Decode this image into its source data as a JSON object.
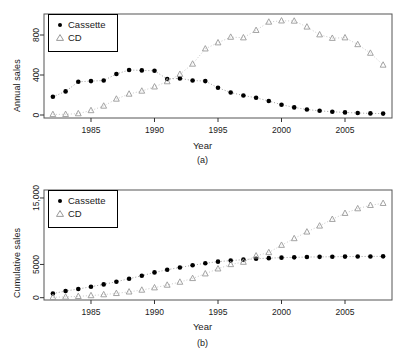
{
  "figure": {
    "panels": [
      {
        "id": "a",
        "caption": "(a)",
        "xlabel": "Year",
        "ylabel": "Annual sales",
        "legend": [
          {
            "label": "Cassette",
            "symbol": "filled-circle"
          },
          {
            "label": "CD",
            "symbol": "open-triangle"
          }
        ]
      },
      {
        "id": "b",
        "caption": "(b)",
        "xlabel": "Year",
        "ylabel": "Cumulative sales",
        "legend": [
          {
            "label": "Cassette",
            "symbol": "filled-circle"
          },
          {
            "label": "CD",
            "symbol": "open-triangle"
          }
        ]
      }
    ]
  },
  "chart_data": [
    {
      "type": "scatter",
      "panel": "a",
      "title": "",
      "xlabel": "Year",
      "ylabel": "Annual sales",
      "xlim": [
        1981.3,
        2008.7
      ],
      "ylim": [
        -30,
        1010
      ],
      "xticks": [
        1985,
        1990,
        1995,
        2000,
        2005
      ],
      "yticks": [
        0,
        400,
        800
      ],
      "ytick_labels": [
        "0",
        "400",
        "800"
      ],
      "grid": false,
      "legend_position": "top-left",
      "x": [
        1982,
        1983,
        1984,
        1985,
        1986,
        1987,
        1988,
        1989,
        1990,
        1991,
        1992,
        1993,
        1994,
        1995,
        1996,
        1997,
        1998,
        1999,
        2000,
        2001,
        2002,
        2003,
        2004,
        2005,
        2006,
        2007,
        2008
      ],
      "series": [
        {
          "name": "Cassette",
          "symbol": "filled-circle",
          "color": "#000000",
          "values": [
            182,
            236,
            332,
            339,
            345,
            410,
            450,
            446,
            442,
            360,
            366,
            345,
            339,
            272,
            225,
            195,
            172,
            140,
            103,
            76,
            55,
            42,
            32,
            26,
            20,
            16,
            14
          ]
        },
        {
          "name": "CD",
          "symbol": "open-triangle",
          "color": "#9a9a9a",
          "values": [
            6,
            7,
            14,
            45,
            90,
            160,
            210,
            240,
            282,
            334,
            408,
            510,
            662,
            723,
            779,
            773,
            847,
            930,
            942,
            940,
            881,
            803,
            768,
            773,
            705,
            619,
            500
          ]
        }
      ]
    },
    {
      "type": "scatter",
      "panel": "b",
      "title": "",
      "xlabel": "Year",
      "ylabel": "Cumulative sales",
      "xlim": [
        1981.3,
        2008.7
      ],
      "ylim": [
        -350,
        16200
      ],
      "xticks": [
        1985,
        1990,
        1995,
        2000,
        2005
      ],
      "yticks": [
        0,
        5000,
        15000
      ],
      "ytick_labels": [
        "0",
        "5000",
        "15,000"
      ],
      "grid": false,
      "legend_position": "top-left",
      "x": [
        1982,
        1983,
        1984,
        1985,
        1986,
        1987,
        1988,
        1989,
        1990,
        1991,
        1992,
        1993,
        1994,
        1995,
        1996,
        1997,
        1998,
        1999,
        2000,
        2001,
        2002,
        2003,
        2004,
        2005,
        2006,
        2007,
        2008
      ],
      "series": [
        {
          "name": "Cassette",
          "symbol": "filled-circle",
          "color": "#000000",
          "values": [
            620,
            1000,
            1300,
            1650,
            2000,
            2400,
            2850,
            3300,
            3800,
            4200,
            4550,
            4880,
            5180,
            5420,
            5580,
            5720,
            5860,
            5950,
            6020,
            6070,
            6110,
            6140,
            6160,
            6180,
            6195,
            6205,
            6215
          ]
        },
        {
          "name": "CD",
          "symbol": "open-triangle",
          "color": "#9a9a9a",
          "values": [
            60,
            110,
            200,
            320,
            460,
            650,
            880,
            1150,
            1500,
            1900,
            2350,
            2900,
            3600,
            4350,
            5000,
            5350,
            6300,
            6800,
            7900,
            8900,
            9900,
            10800,
            11800,
            12700,
            13400,
            13900,
            14200
          ]
        }
      ]
    }
  ]
}
